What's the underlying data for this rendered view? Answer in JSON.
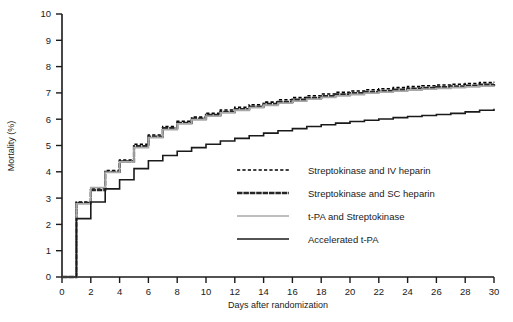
{
  "chart_data": {
    "type": "line",
    "subtype": "kaplan-meier-step",
    "title": "",
    "xlabel": "Days after randomization",
    "ylabel": "Mortality (%)",
    "xlim": [
      0,
      30
    ],
    "ylim": [
      0,
      10
    ],
    "xticks": [
      0,
      2,
      4,
      6,
      8,
      10,
      12,
      14,
      16,
      18,
      20,
      22,
      24,
      26,
      28,
      30
    ],
    "xtick_labels": [
      "0",
      "2",
      "4",
      "6",
      "8",
      "10",
      "12",
      "14",
      "16",
      "18",
      "20",
      "22",
      "24",
      "26",
      "28",
      "30"
    ],
    "yticks": [
      0,
      1,
      2,
      3,
      4,
      5,
      6,
      7,
      8,
      9,
      10
    ],
    "ytick_labels": [
      "0",
      "1",
      "2",
      "3",
      "4",
      "5",
      "6",
      "7",
      "8",
      "9",
      "10"
    ],
    "grid": false,
    "legend_position": "center-right-inside",
    "x": [
      0,
      1,
      2,
      3,
      4,
      5,
      6,
      7,
      8,
      9,
      10,
      11,
      12,
      13,
      14,
      15,
      16,
      17,
      18,
      19,
      20,
      21,
      22,
      23,
      24,
      25,
      26,
      27,
      28,
      29,
      30
    ],
    "series": [
      {
        "name": "Streptokinase and IV heparin",
        "color": "#000000",
        "style": "dotted",
        "width": 1.6,
        "values": [
          0.0,
          2.85,
          3.38,
          4.05,
          4.45,
          5.05,
          5.4,
          5.72,
          5.92,
          6.08,
          6.22,
          6.35,
          6.45,
          6.55,
          6.65,
          6.74,
          6.82,
          6.89,
          6.96,
          7.02,
          7.07,
          7.12,
          7.16,
          7.2,
          7.24,
          7.27,
          7.3,
          7.33,
          7.36,
          7.39,
          7.42
        ]
      },
      {
        "name": "Streptokinase and SC heparin",
        "color": "#262626",
        "style": "heavy-solid",
        "width": 2.3,
        "values": [
          0.0,
          2.82,
          3.3,
          4.0,
          4.4,
          4.98,
          5.34,
          5.66,
          5.86,
          6.02,
          6.16,
          6.28,
          6.38,
          6.48,
          6.58,
          6.66,
          6.74,
          6.81,
          6.88,
          6.94,
          6.99,
          7.04,
          7.08,
          7.12,
          7.16,
          7.19,
          7.22,
          7.25,
          7.28,
          7.31,
          7.34
        ]
      },
      {
        "name": "t-PA and Streptokinase",
        "color": "#a8a8a8",
        "style": "solid",
        "width": 1.8,
        "values": [
          0.0,
          2.78,
          3.4,
          3.98,
          4.38,
          4.92,
          5.3,
          5.6,
          5.82,
          5.98,
          6.12,
          6.24,
          6.34,
          6.44,
          6.53,
          6.61,
          6.69,
          6.76,
          6.83,
          6.89,
          6.94,
          6.99,
          7.03,
          7.07,
          7.11,
          7.14,
          7.17,
          7.2,
          7.23,
          7.26,
          7.28
        ]
      },
      {
        "name": "Accelerated t-PA",
        "color": "#1a1a1a",
        "style": "solid",
        "width": 1.6,
        "values": [
          0.0,
          2.22,
          2.85,
          3.35,
          3.7,
          4.12,
          4.42,
          4.62,
          4.78,
          4.92,
          5.05,
          5.17,
          5.27,
          5.37,
          5.47,
          5.56,
          5.64,
          5.72,
          5.79,
          5.85,
          5.91,
          5.96,
          6.01,
          6.06,
          6.1,
          6.14,
          6.18,
          6.22,
          6.28,
          6.34,
          6.4
        ]
      }
    ],
    "legend": [
      {
        "label": "Streptokinase and IV heparin",
        "color": "#000000",
        "style": "dotted"
      },
      {
        "label": "Streptokinase and SC heparin",
        "color": "#262626",
        "style": "heavy-solid"
      },
      {
        "label": "t-PA and Streptokinase",
        "color": "#a8a8a8",
        "style": "solid"
      },
      {
        "label": "Accelerated t-PA",
        "color": "#1a1a1a",
        "style": "solid"
      }
    ]
  }
}
